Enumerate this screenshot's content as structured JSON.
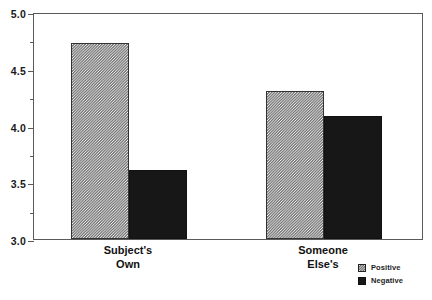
{
  "chart_data": {
    "type": "bar",
    "title": "",
    "subtitle": "",
    "xlabel": "",
    "ylabel": "",
    "categories": [
      "Subject's\nOwn",
      "Someone\nElse's"
    ],
    "series": [
      {
        "name": "Positive",
        "values": [
          4.73,
          4.3
        ],
        "swatch": "hatched",
        "color": "#c9c9c9"
      },
      {
        "name": "Negative",
        "values": [
          3.61,
          4.08
        ],
        "swatch": "solid",
        "color": "#171717"
      }
    ],
    "ylim": [
      3.0,
      5.0
    ],
    "ytick_labels": [
      "5.0",
      "4.5",
      "4.0",
      "3.5",
      "3.0"
    ],
    "ytick_values": [
      5.0,
      4.5,
      4.0,
      3.5,
      3.0
    ],
    "yminor_values": [
      4.75,
      4.25,
      3.75,
      3.25
    ],
    "grid": false,
    "legend_position": "bottom-right",
    "frame": true
  },
  "axis": {
    "ticks": [
      {
        "label": "5.0",
        "value": 5.0
      },
      {
        "label": "4.5",
        "value": 4.5
      },
      {
        "label": "4.0",
        "value": 4.0
      },
      {
        "label": "3.5",
        "value": 3.5
      },
      {
        "label": "3.0",
        "value": 3.0
      }
    ]
  },
  "groups": [
    {
      "label": "Subject's\nOwn",
      "positive": 4.73,
      "negative": 3.61
    },
    {
      "label": "Someone\nElse's",
      "positive": 4.3,
      "negative": 4.08
    }
  ],
  "legend": {
    "items": [
      {
        "label": "Positive",
        "swatch": "hatched"
      },
      {
        "label": "Negative",
        "swatch": "solid"
      }
    ]
  }
}
